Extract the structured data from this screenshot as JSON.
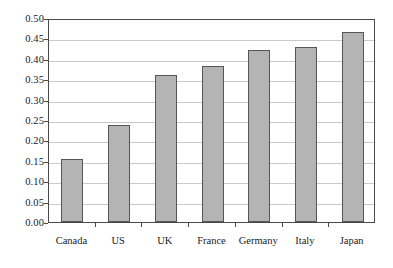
{
  "chart_data": {
    "type": "bar",
    "title": "",
    "subtitle": "",
    "xlabel": "",
    "ylabel": "",
    "categories": [
      "Canada",
      "US",
      "UK",
      "France",
      "Germany",
      "Italy",
      "Japan"
    ],
    "values": [
      0.155,
      0.238,
      0.36,
      0.382,
      0.421,
      0.43,
      0.466
    ],
    "series": [
      {
        "name": "",
        "values": [
          0.155,
          0.238,
          0.36,
          0.382,
          0.421,
          0.43,
          0.466
        ]
      }
    ],
    "ylim": [
      0.0,
      0.5
    ],
    "ytick_values": [
      0.0,
      0.05,
      0.1,
      0.15,
      0.2,
      0.25,
      0.3,
      0.35,
      0.4,
      0.45,
      0.5
    ],
    "ytick_labels": [
      "0.00",
      "0.05",
      "0.10",
      "0.15",
      "0.20",
      "0.25",
      "0.30",
      "0.35",
      "0.40",
      "0.45",
      "0.50"
    ],
    "grid": "horizontal",
    "legend": "none",
    "bar_fill_color": "#b4b4b4",
    "bar_border_color": "#555555",
    "gridline_color": "#c9c9c9",
    "axis_color": "#4a4a4a",
    "background_color": "#ffffff",
    "text_color": "#1a1a1a"
  }
}
